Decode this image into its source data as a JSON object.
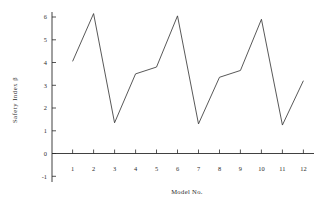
{
  "chart_data": {
    "type": "line",
    "title": "",
    "xlabel": "Model No.",
    "ylabel": "Safety Index β",
    "categories": [
      1,
      2,
      3,
      4,
      5,
      6,
      7,
      8,
      9,
      10,
      11,
      12
    ],
    "x_tick_labels": [
      "1",
      "2",
      "3",
      "4",
      "5",
      "6",
      "7",
      "8",
      "9",
      "10",
      "11",
      "12"
    ],
    "y_tick_labels": [
      "-1",
      "0",
      "1",
      "2",
      "3",
      "4",
      "5",
      "6"
    ],
    "y_tick_values": [
      -1,
      0,
      1,
      2,
      3,
      4,
      5,
      6
    ],
    "values": [
      4.05,
      6.15,
      1.35,
      3.5,
      3.8,
      6.05,
      1.3,
      3.35,
      3.65,
      5.9,
      1.25,
      3.2
    ],
    "series": [
      {
        "name": "Safety Index β",
        "values": [
          4.05,
          6.15,
          1.35,
          3.5,
          3.8,
          6.05,
          1.3,
          3.35,
          3.65,
          5.9,
          1.25,
          3.2
        ]
      }
    ],
    "xlim": [
      0.45,
      12.55
    ],
    "ylim": [
      -1,
      6.55
    ],
    "grid": false,
    "legend": false,
    "legend_position": "none",
    "line_color": "#3a3a3a",
    "axis_color": "#2b2b2b",
    "background_color": "#ffffff",
    "marker": "none"
  }
}
